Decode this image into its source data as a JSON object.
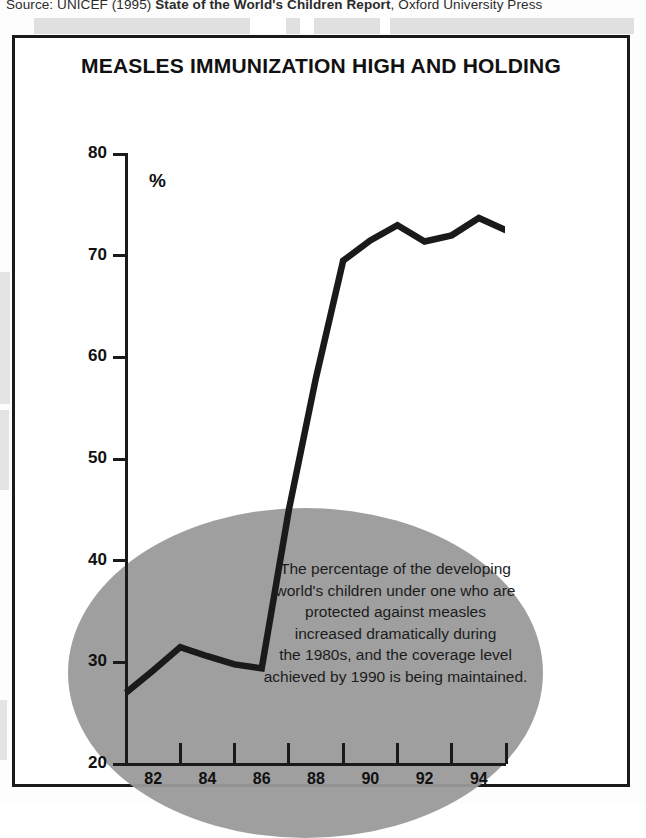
{
  "source": {
    "prefix": "Source: UNICEF (1995) ",
    "bold": "State of the World's Children Report",
    "suffix": ", Oxford University Press"
  },
  "chart": {
    "title": "MEASLES IMMUNIZATION HIGH AND HOLDING",
    "unit_label": "%",
    "annotation_lines": [
      "The percentage of the developing",
      "world's children under one who are",
      "protected against measles",
      "increased dramatically  during",
      "the 1980s, and the coverage level",
      "achieved by 1990 is being maintained."
    ],
    "line_color": "#1a1a1a",
    "ellipse_color": "#9a9a9a",
    "frame_color": "#1a1a1a"
  },
  "chart_data": {
    "type": "line",
    "title": "MEASLES IMMUNIZATION HIGH AND HOLDING",
    "xlabel": "",
    "ylabel": "%",
    "ylim": [
      20,
      80
    ],
    "xlim": [
      1981,
      1995
    ],
    "yticks": [
      20,
      30,
      40,
      50,
      60,
      70,
      80
    ],
    "ytick_labels": [
      "20",
      "30",
      "40",
      "50",
      "60",
      "70",
      "80"
    ],
    "xticks": [
      1981,
      1983,
      1985,
      1987,
      1989,
      1991,
      1993,
      1995
    ],
    "xtick_labels": [
      "82",
      "84",
      "86",
      "88",
      "90",
      "92",
      "94"
    ],
    "xtick_label_positions": [
      1982,
      1984,
      1986,
      1988,
      1990,
      1992,
      1994
    ],
    "grid": false,
    "legend": "none",
    "x": [
      1981,
      1982,
      1983,
      1984,
      1985,
      1986,
      1987,
      1988,
      1989,
      1990,
      1991,
      1992,
      1993,
      1994,
      1995
    ],
    "values": [
      27.0,
      29.2,
      31.5,
      30.6,
      29.8,
      29.4,
      45.0,
      58.0,
      69.5,
      71.5,
      73.0,
      71.4,
      72.0,
      73.7,
      72.5
    ],
    "series": [
      {
        "name": "Measles immunization coverage",
        "values": [
          27.0,
          29.2,
          31.5,
          30.6,
          29.8,
          29.4,
          45.0,
          58.0,
          69.5,
          71.5,
          73.0,
          71.4,
          72.0,
          73.7,
          72.5
        ]
      }
    ],
    "annotation": "The percentage of the developing world's children under one who are protected against measles increased dramatically during the 1980s, and the coverage level achieved by 1990 is being maintained."
  }
}
